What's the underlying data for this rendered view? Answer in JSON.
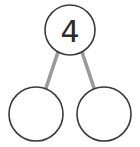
{
  "diagram": {
    "type": "number-bond",
    "background_color": "#ffffff",
    "circle_stroke_color": "#3a3a3a",
    "connector_color": "#9a9a9a",
    "text_color": "#2b2b2b",
    "whole": {
      "label": "4",
      "value": "4",
      "filled": true,
      "cx": 70,
      "cy": 30,
      "r": 25
    },
    "parts": [
      {
        "label": "",
        "value": "",
        "filled": false,
        "position": "left",
        "cx": 36,
        "cy": 114,
        "r": 27
      },
      {
        "label": "",
        "value": "",
        "filled": false,
        "position": "right",
        "cx": 104,
        "cy": 114,
        "r": 27
      }
    ],
    "connectors": [
      {
        "name": "whole-to-left-part",
        "x1": 58,
        "y1": 52,
        "x2": 45,
        "y2": 91
      },
      {
        "name": "whole-to-right-part",
        "x1": 82,
        "y1": 52,
        "x2": 95,
        "y2": 91
      }
    ]
  }
}
